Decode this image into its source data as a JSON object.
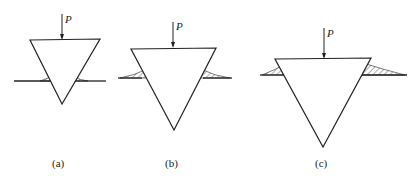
{
  "figure": {
    "panels": [
      {
        "id": "a",
        "caption": "(a)",
        "load_label": "P",
        "stage": "initial penetration, small pile-up"
      },
      {
        "id": "b",
        "caption": "(b)",
        "load_label": "P",
        "stage": "deeper penetration, medium pile-up"
      },
      {
        "id": "c",
        "caption": "(c)",
        "load_label": "P",
        "stage": "deepest penetration, large pile-up"
      }
    ],
    "colors": {
      "stroke": "#222222",
      "background": "#ffffff"
    }
  }
}
